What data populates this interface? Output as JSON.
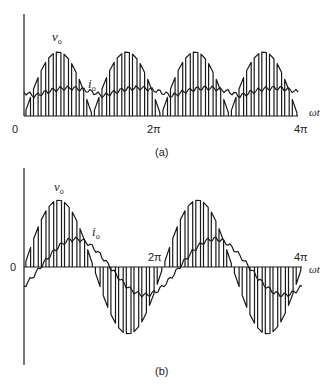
{
  "figure_a": {
    "caption": "(a)",
    "labels": {
      "vo": "v",
      "vo_sub": "o",
      "io": "i",
      "io_sub": "o",
      "origin": "0",
      "tick_2pi": "2π",
      "tick_4pi": "4π",
      "x_axis": "ωt"
    },
    "geometry": {
      "x0": 24,
      "x4pi": 298,
      "baseline": 116,
      "axis_top": 14,
      "peak_y": 52,
      "current_mean_y": 96,
      "current_ripple": 8
    },
    "type": "rectified PWM (unipolar, |sin|)",
    "half_cycles": 4,
    "pulses_per_half_cycle": 9
  },
  "figure_b": {
    "caption": "(b)",
    "labels": {
      "vo": "v",
      "vo_sub": "o",
      "io": "i",
      "io_sub": "o",
      "origin": "0",
      "tick_2pi": "2π",
      "tick_4pi": "4π",
      "x_axis": "ωt"
    },
    "geometry": {
      "x0": 24,
      "x4pi": 302,
      "zero_y": 267,
      "axis_top": 168,
      "axis_bottom": 365,
      "peak_y": 200,
      "current_amp": 28,
      "current_lag_rad": 0.75
    },
    "type": "bipolar PWM (sin)",
    "cycles": 2,
    "pulses_per_half_cycle": 9
  },
  "colors": {
    "stroke": "#1a1a1a",
    "background": "#ffffff"
  }
}
